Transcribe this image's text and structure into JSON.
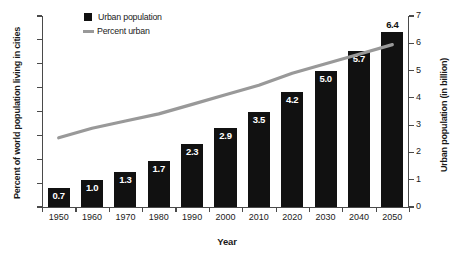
{
  "chart_data": {
    "type": "bar",
    "title": "",
    "subtitle": "",
    "xlabel": "Year",
    "ylabel": "Percent of world population living in cities",
    "y2label": "Urban population (in billion)",
    "categories": [
      "1950",
      "1960",
      "1970",
      "1980",
      "1990",
      "2000",
      "2010",
      "2020",
      "2030",
      "2040",
      "2050"
    ],
    "ylim": [
      0,
      80
    ],
    "y2lim": [
      0,
      7
    ],
    "yticks": [
      0,
      10,
      20,
      30,
      40,
      50,
      60,
      70,
      80
    ],
    "y2ticks": [
      0,
      1,
      2,
      3,
      4,
      5,
      6,
      7
    ],
    "grid": false,
    "legend_position": "top-left",
    "series": [
      {
        "name": "Urban population",
        "type": "bar",
        "axis": "right",
        "unit": "billion",
        "color": "#111111",
        "values": [
          0.7,
          1.0,
          1.3,
          1.7,
          2.3,
          2.9,
          3.5,
          4.2,
          5.0,
          5.7,
          6.4
        ],
        "labels": [
          "0.7",
          "1.0",
          "1.3",
          "1.7",
          "2.3",
          "2.9",
          "3.5",
          "4.2",
          "5.0",
          "5.7",
          "6.4"
        ],
        "label_outside": [
          false,
          false,
          false,
          false,
          false,
          false,
          false,
          false,
          false,
          false,
          true
        ]
      },
      {
        "name": "Percent urban",
        "type": "line",
        "axis": "left",
        "unit": "percent",
        "color": "#999999",
        "values": [
          29,
          33,
          36,
          39,
          43,
          47,
          51,
          56,
          60,
          64,
          68
        ]
      }
    ]
  },
  "legend": {
    "items": [
      {
        "label": "Urban population",
        "marker": "square",
        "color": "#111111"
      },
      {
        "label": "Percent urban",
        "marker": "line",
        "color": "#999999"
      }
    ]
  },
  "axes": {
    "left_title": "Percent of world population living in cities",
    "right_title": "Urban population (in billion)",
    "x_title": "Year",
    "left_tick_labels": [
      "0",
      "10",
      "20",
      "30",
      "40",
      "50",
      "60",
      "70",
      "80"
    ],
    "right_tick_labels": [
      "0",
      "1",
      "2",
      "3",
      "4",
      "5",
      "6",
      "7"
    ],
    "x_tick_labels": [
      "1950",
      "1960",
      "1970",
      "1980",
      "1990",
      "2000",
      "2010",
      "2020",
      "2030",
      "2040",
      "2050"
    ]
  },
  "colors": {
    "bar": "#111111",
    "line": "#999999",
    "axis": "#4a4a4a",
    "text": "#1a1a1a",
    "background": "#ffffff"
  }
}
